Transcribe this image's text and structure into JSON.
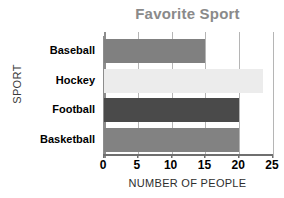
{
  "chart_data": {
    "type": "bar",
    "orientation": "horizontal",
    "title": "Favorite Sport",
    "xlabel": "NUMBER OF PEOPLE",
    "ylabel": "SPORT",
    "categories": [
      "Baseball",
      "Hockey",
      "Football",
      "Basketball"
    ],
    "values": [
      15,
      23.5,
      20,
      20
    ],
    "bar_colors": [
      "#808080",
      "#ececec",
      "#4a4a4a",
      "#828282"
    ],
    "xlim": [
      0,
      25
    ],
    "xticks": [
      0,
      5,
      10,
      15,
      20,
      25
    ],
    "xtick_labels": [
      "0",
      "5",
      "10",
      "15",
      "20",
      "25"
    ],
    "grid": "vertical",
    "legend": "none",
    "title_color": "#8a8a8a",
    "axis_text_color": "#000000",
    "gridline_color": "#b5b5b5",
    "background": "#ffffff"
  }
}
